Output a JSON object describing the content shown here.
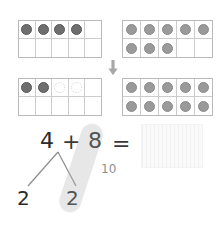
{
  "worksheet": {
    "title": "Make a ten: 4 + 8",
    "background_color": "#ffffff"
  },
  "colors": {
    "counter_dark": "#6e6e6e",
    "counter_mid": "#9a9a9a",
    "ghost_outline": "#d6d6d6",
    "frame_border": "#b9b9b9",
    "cell_border": "#cccccc",
    "text": "#2b2b2b",
    "muted_text": "#8f8f8f",
    "highlighter": "rgba(176,176,176,0.30)"
  },
  "frames": {
    "top_left": {
      "name": "ten-frame-top-left",
      "count_label": "4",
      "rows": [
        [
          "dark",
          "dark",
          "dark",
          "dark",
          "empty"
        ],
        [
          "empty",
          "empty",
          "empty",
          "empty",
          "empty"
        ]
      ]
    },
    "top_right": {
      "name": "ten-frame-top-right",
      "count_label": "8",
      "rows": [
        [
          "mid",
          "mid",
          "mid",
          "mid",
          "mid"
        ],
        [
          "mid",
          "mid",
          "mid",
          "empty",
          "empty"
        ]
      ]
    },
    "bottom_left": {
      "name": "ten-frame-bottom-left",
      "count_label": "2",
      "rows": [
        [
          "dark",
          "dark",
          "ghost",
          "ghost",
          "empty"
        ],
        [
          "empty",
          "empty",
          "empty",
          "empty",
          "empty"
        ]
      ]
    },
    "bottom_right": {
      "name": "ten-frame-bottom-right",
      "count_label": "10",
      "rows": [
        [
          "mid",
          "mid",
          "mid",
          "mid",
          "mid"
        ],
        [
          "mid",
          "mid",
          "mid",
          "mid",
          "mid"
        ]
      ]
    }
  },
  "arrow": {
    "icon": "arrow-down-icon",
    "direction": "down"
  },
  "equation": {
    "left_term": "4",
    "operator": "+",
    "right_term": "8",
    "equals": "=",
    "answer": "",
    "answer_placeholder": ""
  },
  "number_bond": {
    "whole": "4",
    "part_left": "2",
    "part_right": "2"
  },
  "annotation": {
    "tens_label": "10"
  }
}
